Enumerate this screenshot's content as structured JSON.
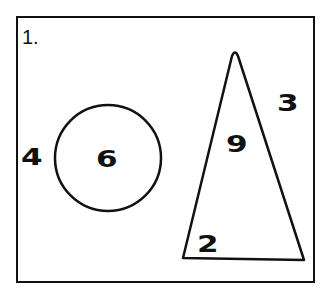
{
  "panel": {
    "title": "1.",
    "shapes": [
      {
        "type": "circle",
        "inside_label": "6",
        "outside_label": "4"
      },
      {
        "type": "triangle",
        "inside_labels": [
          "9",
          "2"
        ],
        "outside_label": "3"
      }
    ]
  },
  "labels": {
    "title": "1.",
    "left_outside": "4",
    "circle_inside": "6",
    "triangle_outside": "3",
    "triangle_upper": "9",
    "triangle_lower": "2"
  }
}
